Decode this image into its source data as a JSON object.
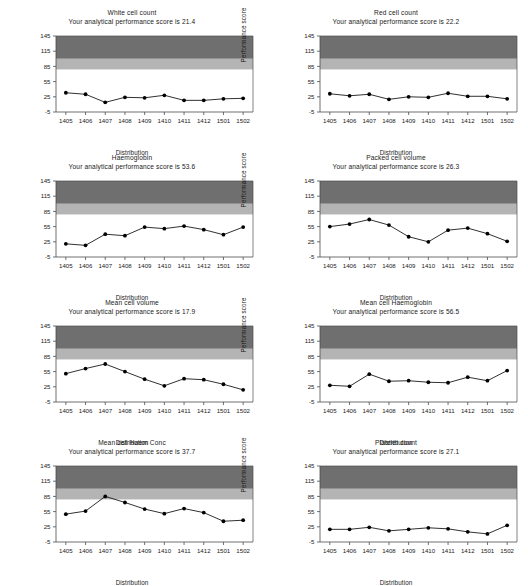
{
  "figure": {
    "axis_titles": {
      "x": "Distribution",
      "y": "Performance score"
    },
    "score_prefix": "Your analytical performance score is",
    "colors": {
      "dark_band": "#6f6f6f",
      "mid_band": "#b4b4b4",
      "plot_background": "#ffffff",
      "line": "#1a1a1a",
      "marker": "#000000",
      "axis": "#4d4d4d",
      "text": "#1a1a1a"
    },
    "bands": {
      "dark": [
        100,
        145
      ],
      "mid": [
        79,
        100
      ]
    },
    "yticks": [
      -5,
      25,
      55,
      85,
      115,
      145
    ],
    "ylim": [
      -5,
      145
    ],
    "categories": [
      "1405",
      "1406",
      "1407",
      "1408",
      "1409",
      "1410",
      "1411",
      "1412",
      "1501",
      "1502"
    ]
  },
  "chart_data": [
    {
      "type": "line",
      "title": "White cell count",
      "subtitle": "Your analytical performance score is 21.4",
      "score": 21.4,
      "xlabel": "Distribution",
      "ylabel": "Performance score",
      "ylim": [
        -5,
        145
      ],
      "yticks": [
        -5,
        25,
        55,
        85,
        115,
        145
      ],
      "grid": false,
      "legend": "none",
      "categories": [
        "1405",
        "1406",
        "1407",
        "1408",
        "1409",
        "1410",
        "1411",
        "1412",
        "1501",
        "1502"
      ],
      "values": [
        33,
        30,
        14,
        24,
        23,
        28,
        18,
        18,
        21,
        22
      ]
    },
    {
      "type": "line",
      "title": "Red cell count",
      "subtitle": "Your analytical performance score is 22.2",
      "score": 22.2,
      "xlabel": "Distribution",
      "ylabel": "Performance score",
      "ylim": [
        -5,
        145
      ],
      "yticks": [
        -5,
        25,
        55,
        85,
        115,
        145
      ],
      "grid": false,
      "legend": "none",
      "categories": [
        "1405",
        "1406",
        "1407",
        "1408",
        "1409",
        "1410",
        "1411",
        "1412",
        "1501",
        "1502"
      ],
      "values": [
        31,
        27,
        30,
        20,
        25,
        24,
        32,
        26,
        26,
        21
      ]
    },
    {
      "type": "line",
      "title": "Haemoglobin",
      "subtitle": "Your analytical performance score is 53.6",
      "score": 53.6,
      "xlabel": "Distribution",
      "ylabel": "Performance score",
      "ylim": [
        -5,
        145
      ],
      "yticks": [
        -5,
        25,
        55,
        85,
        115,
        145
      ],
      "grid": false,
      "legend": "none",
      "categories": [
        "1405",
        "1406",
        "1407",
        "1408",
        "1409",
        "1410",
        "1411",
        "1412",
        "1501",
        "1502"
      ],
      "values": [
        21,
        18,
        40,
        37,
        54,
        51,
        56,
        49,
        39,
        54
      ]
    },
    {
      "type": "line",
      "title": "Packed cell volume",
      "subtitle": "Your analytical performance score is 26.3",
      "score": 26.3,
      "xlabel": "Distribution",
      "ylabel": "Performance score",
      "ylim": [
        -5,
        145
      ],
      "yticks": [
        -5,
        25,
        55,
        85,
        115,
        145
      ],
      "grid": false,
      "legend": "none",
      "categories": [
        "1405",
        "1406",
        "1407",
        "1408",
        "1409",
        "1410",
        "1411",
        "1412",
        "1501",
        "1502"
      ],
      "values": [
        55,
        60,
        69,
        58,
        35,
        25,
        48,
        52,
        41,
        26
      ]
    },
    {
      "type": "line",
      "title": "Mean cell volume",
      "subtitle": "Your analytical performance score is 17.9",
      "score": 17.9,
      "xlabel": "Distribution",
      "ylabel": "Performance score",
      "ylim": [
        -5,
        145
      ],
      "yticks": [
        -5,
        25,
        55,
        85,
        115,
        145
      ],
      "grid": false,
      "legend": "none",
      "categories": [
        "1405",
        "1406",
        "1407",
        "1408",
        "1409",
        "1410",
        "1411",
        "1412",
        "1501",
        "1502"
      ],
      "values": [
        51,
        61,
        70,
        55,
        40,
        27,
        41,
        39,
        30,
        19
      ]
    },
    {
      "type": "line",
      "title": "Mean cell Haemoglobin",
      "subtitle": "Your analytical performance score is 56.5",
      "score": 56.5,
      "xlabel": "Distribution",
      "ylabel": "Performance score",
      "ylim": [
        -5,
        145
      ],
      "yticks": [
        -5,
        25,
        55,
        85,
        115,
        145
      ],
      "grid": false,
      "legend": "none",
      "categories": [
        "1405",
        "1406",
        "1407",
        "1408",
        "1409",
        "1410",
        "1411",
        "1412",
        "1501",
        "1502"
      ],
      "values": [
        28,
        26,
        50,
        36,
        37,
        34,
        33,
        44,
        37,
        57
      ]
    },
    {
      "type": "line",
      "title": "Mean cell Haem Conc",
      "subtitle": "Your analytical performance score is 37.7",
      "score": 37.7,
      "xlabel": "Distribution",
      "ylabel": "Performance score",
      "ylim": [
        -5,
        145
      ],
      "yticks": [
        -5,
        25,
        55,
        85,
        115,
        145
      ],
      "grid": false,
      "legend": "none",
      "categories": [
        "1405",
        "1406",
        "1407",
        "1408",
        "1409",
        "1410",
        "1411",
        "1412",
        "1501",
        "1502"
      ],
      "values": [
        50,
        56,
        85,
        73,
        60,
        51,
        61,
        53,
        36,
        38
      ]
    },
    {
      "type": "line",
      "title": "Platelet count",
      "subtitle": "Your analytical performance score is 27.1",
      "score": 27.1,
      "xlabel": "Distribution",
      "ylabel": "Performance score",
      "ylim": [
        -5,
        145
      ],
      "yticks": [
        -5,
        25,
        55,
        85,
        115,
        145
      ],
      "grid": false,
      "legend": "none",
      "categories": [
        "1405",
        "1406",
        "1407",
        "1408",
        "1409",
        "1410",
        "1411",
        "1412",
        "1501",
        "1502"
      ],
      "values": [
        20,
        20,
        24,
        17,
        20,
        23,
        21,
        15,
        11,
        28
      ]
    }
  ]
}
